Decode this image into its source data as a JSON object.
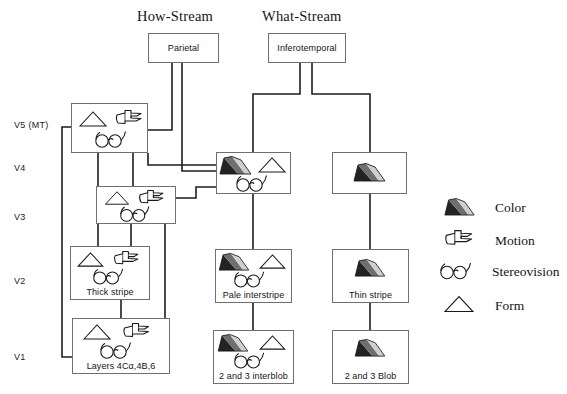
{
  "titles": {
    "how_stream": "How-Stream",
    "what_stream": "What-Stream"
  },
  "tier_labels": [
    {
      "id": "v5",
      "text": "V5  (MT)"
    },
    {
      "id": "v4",
      "text": "V4"
    },
    {
      "id": "v3",
      "text": "V3"
    },
    {
      "id": "v2",
      "text": "V2"
    },
    {
      "id": "v1",
      "text": "V1"
    }
  ],
  "nodes": {
    "parietal": {
      "caption": "Parietal",
      "icons": []
    },
    "inferotemporal": {
      "caption": "Inferotemporal",
      "icons": []
    },
    "v5": {
      "caption": "",
      "icons": [
        "form",
        "motion",
        "stereovision"
      ]
    },
    "v4_mid": {
      "caption": "",
      "icons": [
        "color",
        "form",
        "stereovision"
      ]
    },
    "v4_right": {
      "caption": "",
      "icons": [
        "color"
      ]
    },
    "v3": {
      "caption": "",
      "icons": [
        "form",
        "motion",
        "stereovision"
      ]
    },
    "v2_thick": {
      "caption": "Thick stripe",
      "icons": [
        "form",
        "motion",
        "stereovision"
      ]
    },
    "v2_pale": {
      "caption": "Pale interstripe",
      "icons": [
        "color",
        "form",
        "stereovision"
      ]
    },
    "v2_thin": {
      "caption": "Thin stripe",
      "icons": [
        "color"
      ]
    },
    "v1_layers": {
      "caption": "Layers 4Cα,4B,6",
      "icons": [
        "form",
        "motion",
        "stereovision"
      ]
    },
    "v1_interblob": {
      "caption": "2 and 3 interblob",
      "icons": [
        "color",
        "form",
        "stereovision"
      ]
    },
    "v1_blob": {
      "caption": "2 and 3 Blob",
      "icons": [
        "color"
      ]
    }
  },
  "legend": [
    {
      "icon": "color",
      "label": "Color"
    },
    {
      "icon": "motion",
      "label": "Motion"
    },
    {
      "icon": "stereovision",
      "label": "Stereovision"
    },
    {
      "icon": "form",
      "label": "Form"
    }
  ],
  "colors": {
    "line": "#1d1d1d",
    "box_border": "#6f6f6f",
    "ink": "#141414",
    "background": "#ffffff",
    "color_icon_dark": "#232323",
    "color_icon_mid": "#7d7d7d",
    "color_icon_light": "#c9c9c9"
  }
}
